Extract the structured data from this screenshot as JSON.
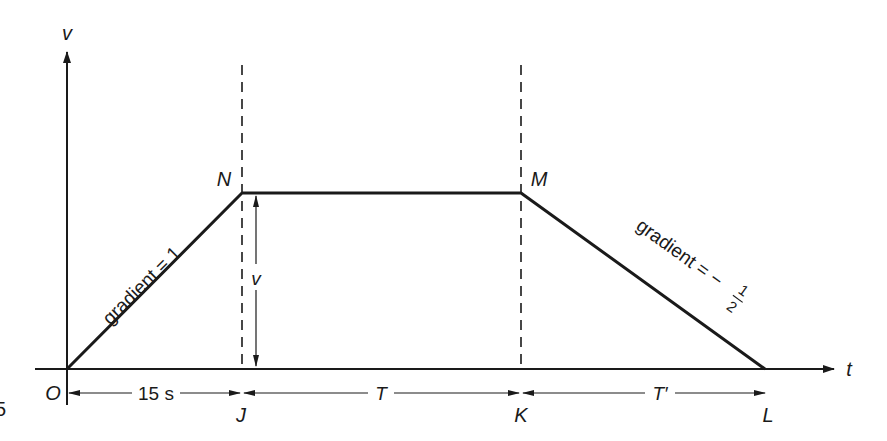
{
  "diagram": {
    "type": "velocity-time graph",
    "axes": {
      "y_label": "v",
      "x_label": "t"
    },
    "points": {
      "origin": "O",
      "peak_start": "N",
      "peak_end": "M",
      "end": "L",
      "j_foot": "J",
      "k_foot": "K"
    },
    "segments": {
      "acceleration": {
        "label": "gradient = 1",
        "from": "O",
        "to": "N"
      },
      "constant": {
        "from": "N",
        "to": "M"
      },
      "deceleration": {
        "label_prefix": "gradient = −",
        "numerator": "1",
        "denominator": "2",
        "from": "M",
        "to": "L"
      }
    },
    "height_marker": {
      "label": "v"
    },
    "intervals": [
      {
        "label": "15 s",
        "from": "O",
        "to": "J"
      },
      {
        "label": "T",
        "from": "J",
        "to": "K"
      },
      {
        "label": "T′",
        "from": "K",
        "to": "L"
      }
    ],
    "edge_fragment": "5",
    "colors": {
      "ink": "#1a1a1a",
      "background": "#ffffff"
    }
  }
}
